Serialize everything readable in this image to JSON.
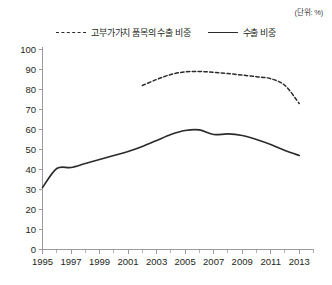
{
  "unit_label": "(단위: %)",
  "legend": {
    "entries": [
      {
        "label": "고부가가치 품목의 수출 비중",
        "style": "dashed"
      },
      {
        "label": "수출 비중",
        "style": "solid"
      }
    ]
  },
  "axes": {
    "y_ticks": [
      "100",
      "90",
      "80",
      "70",
      "60",
      "50",
      "40",
      "30",
      "20",
      "10",
      "0"
    ],
    "x_ticks": [
      "1995",
      "1997",
      "1999",
      "2001",
      "2003",
      "2005",
      "2007",
      "2009",
      "2011",
      "2013"
    ]
  },
  "chart_data": {
    "type": "line",
    "title": "",
    "subtitle": "",
    "xlabel": "",
    "ylabel": "",
    "unit": "%",
    "xlim": [
      1995,
      2014
    ],
    "ylim": [
      0,
      100
    ],
    "y_tick_step": 10,
    "x_tick_step": 2,
    "x_minor_tick_step": 1,
    "grid": false,
    "legend_position": "top-center",
    "x": [
      1995,
      1996,
      1997,
      1998,
      1999,
      2000,
      2001,
      2002,
      2003,
      2004,
      2005,
      2006,
      2007,
      2008,
      2009,
      2010,
      2011,
      2012,
      2013
    ],
    "series": [
      {
        "name": "고부가가치 품목의 수출 비중",
        "style": "dashed",
        "color": "#2b2b2b",
        "x": [
          2002,
          2003,
          2004,
          2005,
          2006,
          2007,
          2008,
          2009,
          2010,
          2011,
          2012,
          2013
        ],
        "values": [
          82,
          85,
          87.5,
          88.8,
          89,
          88.6,
          88,
          87.2,
          86.4,
          85.4,
          82,
          73
        ]
      },
      {
        "name": "수출 비중",
        "style": "solid",
        "color": "#2b2b2b",
        "x": [
          1995,
          1996,
          1997,
          1998,
          1999,
          2000,
          2001,
          2002,
          2003,
          2004,
          2005,
          2006,
          2007,
          2008,
          2009,
          2010,
          2011,
          2012,
          2013
        ],
        "values": [
          31,
          40.5,
          41,
          43,
          45,
          47,
          49,
          51.5,
          54.5,
          57.5,
          59.5,
          59.8,
          57.5,
          57.8,
          57,
          55,
          52.5,
          49.5,
          47
        ]
      }
    ]
  }
}
